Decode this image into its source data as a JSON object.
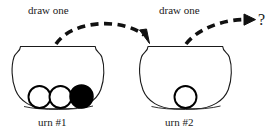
{
  "diagram": {
    "background_color": "#ffffff",
    "stroke_color": "#1a1a1a",
    "ball_fill_white": "#ffffff",
    "ball_fill_black": "#000000"
  },
  "labels": {
    "draw_one_first": "draw one",
    "draw_one_second": "draw one",
    "urn_one": "urn  #1",
    "urn_two": "urn  #2",
    "question_mark": "?"
  },
  "urns": [
    {
      "id": "urn-1",
      "name": "urn  #1",
      "balls": [
        {
          "index": 1,
          "color": "white",
          "hex": "#ffffff"
        },
        {
          "index": 2,
          "color": "white",
          "hex": "#ffffff"
        },
        {
          "index": 3,
          "color": "black",
          "hex": "#000000"
        }
      ],
      "white_count": 2,
      "black_count": 1,
      "total_count": 3
    },
    {
      "id": "urn-2",
      "name": "urn  #2",
      "balls": [
        {
          "index": 1,
          "color": "white",
          "hex": "#ffffff"
        }
      ],
      "white_count": 1,
      "black_count": 0,
      "total_count": 1
    }
  ],
  "arrows": [
    {
      "id": "arrow-1",
      "label": "draw one",
      "from": "urn-1",
      "to": "urn-2",
      "style": "dashed-curved",
      "has_arrowhead": true
    },
    {
      "id": "arrow-2",
      "label": "draw one",
      "from": "urn-2",
      "to": "?",
      "style": "dashed-curved",
      "has_arrowhead": true
    }
  ]
}
